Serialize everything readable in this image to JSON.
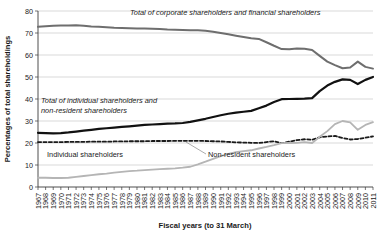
{
  "chart_data": {
    "type": "line",
    "title": "",
    "xlabel": "Fiscal years (to 31 March)",
    "ylabel": "Percentages of total shareholdings",
    "grid": true,
    "legend_position": "inline-annotations",
    "xlim": [
      1967,
      2011
    ],
    "ylim": [
      0,
      80
    ],
    "yticks": [
      0,
      10,
      20,
      30,
      40,
      50,
      60,
      70,
      80
    ],
    "ytick_labels": [
      "0",
      "10",
      "20",
      "30",
      "40",
      "50",
      "60",
      "70",
      "80"
    ],
    "categories": [
      "1967",
      "1968",
      "1969",
      "1970",
      "1971",
      "1972",
      "1973",
      "1974",
      "1975",
      "1976",
      "1977",
      "1978",
      "1979",
      "1980",
      "1981",
      "1982",
      "1983",
      "1984",
      "1985",
      "1986",
      "1987",
      "1988",
      "1989",
      "1990",
      "1991",
      "1992",
      "1993",
      "1994",
      "1995",
      "1996",
      "1997",
      "1998",
      "1999",
      "2000",
      "2001",
      "2002",
      "2003",
      "2004",
      "2005",
      "2006",
      "2007",
      "2008",
      "2009",
      "2010",
      "2011"
    ],
    "series": [
      {
        "name": "Total of corporate shareholders and financial shareholders",
        "color": "#6e6e6e",
        "style": "solid",
        "width": 2.0,
        "values": [
          72.8,
          73.1,
          73.3,
          73.4,
          73.4,
          73.5,
          73.3,
          73.0,
          72.8,
          72.6,
          72.4,
          72.3,
          72.2,
          72.1,
          72.0,
          71.9,
          71.8,
          71.6,
          71.5,
          71.4,
          71.3,
          71.2,
          71.0,
          70.6,
          70.0,
          69.4,
          68.8,
          68.2,
          67.6,
          67.3,
          65.8,
          64.2,
          62.7,
          62.6,
          63.0,
          62.8,
          62.3,
          59.6,
          57.0,
          55.4,
          54.0,
          54.3,
          57.0,
          54.6,
          53.8
        ]
      },
      {
        "name": "Total of individual shareholders and non-resident shareholders",
        "color": "#111111",
        "style": "solid",
        "width": 2.2,
        "values": [
          24.6,
          24.5,
          24.4,
          24.5,
          24.8,
          25.2,
          25.6,
          26.0,
          26.4,
          26.7,
          27.0,
          27.3,
          27.6,
          27.9,
          28.2,
          28.4,
          28.6,
          28.8,
          28.9,
          29.1,
          29.6,
          30.3,
          31.0,
          31.8,
          32.6,
          33.3,
          33.8,
          34.2,
          34.6,
          35.8,
          37.0,
          38.6,
          39.9,
          40.0,
          40.1,
          40.2,
          40.4,
          43.6,
          46.1,
          47.8,
          48.9,
          48.7,
          46.8,
          48.7,
          50.0
        ]
      },
      {
        "name": "Individual shareholders",
        "color": "#1a1a1a",
        "style": "dashed",
        "width": 1.8,
        "values": [
          20.4,
          20.4,
          20.4,
          20.4,
          20.5,
          20.5,
          20.5,
          20.6,
          20.6,
          20.6,
          20.7,
          20.7,
          20.8,
          20.8,
          20.8,
          20.9,
          20.9,
          20.9,
          21.0,
          21.0,
          21.0,
          21.0,
          20.9,
          20.8,
          20.7,
          20.5,
          20.3,
          20.2,
          20.1,
          20.0,
          20.4,
          20.8,
          19.9,
          20.6,
          21.3,
          21.7,
          21.5,
          22.6,
          23.0,
          23.2,
          22.3,
          21.6,
          21.8,
          22.4,
          23.0
        ]
      },
      {
        "name": "Non-resident shareholders",
        "color": "#b5b5b5",
        "style": "solid",
        "width": 1.8,
        "values": [
          4.2,
          4.2,
          4.1,
          4.1,
          4.2,
          4.6,
          5.0,
          5.4,
          5.8,
          6.1,
          6.5,
          6.9,
          7.2,
          7.4,
          7.7,
          7.9,
          8.1,
          8.3,
          8.5,
          8.8,
          9.2,
          10.3,
          11.5,
          12.8,
          14.0,
          15.1,
          15.8,
          16.3,
          16.7,
          17.5,
          18.2,
          19.0,
          19.9,
          20.0,
          20.1,
          20.4,
          20.0,
          22.8,
          25.4,
          28.6,
          30.0,
          29.4,
          26.0,
          28.2,
          29.5
        ]
      }
    ],
    "annotations": [
      {
        "id": "annot-corporate",
        "text": "Total of corporate shareholders and financial shareholders",
        "style": "italic"
      },
      {
        "id": "annot-individual-nonresident-line1",
        "text": "Total of individual shareholders and",
        "style": "italic"
      },
      {
        "id": "annot-individual-nonresident-line2",
        "text": "non-resident shareholders",
        "style": "italic"
      },
      {
        "id": "annot-individual",
        "text": "Individual shareholders",
        "style": "plain"
      },
      {
        "id": "annot-nonresident",
        "text": "Non-resident shareholders",
        "style": "plain"
      }
    ]
  }
}
